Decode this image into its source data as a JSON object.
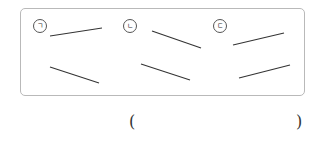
{
  "options": [
    {
      "label": "ㄱ",
      "circle": [
        39,
        25
      ],
      "segments": [
        [
          50,
          36,
          102,
          28
        ],
        [
          50,
          67,
          99,
          83
        ]
      ]
    },
    {
      "label": "ㄴ",
      "circle": [
        129,
        25
      ],
      "segments": [
        [
          152,
          31,
          201,
          48
        ],
        [
          141,
          64,
          190,
          80
        ]
      ]
    },
    {
      "label": "ㄷ",
      "circle": [
        219,
        25
      ],
      "segments": [
        [
          233,
          45,
          284,
          33
        ],
        [
          239,
          78,
          290,
          65
        ]
      ]
    }
  ],
  "answer": {
    "open": "(",
    "close": ")",
    "value": ""
  },
  "colors": {
    "line": "#333333",
    "border": "#b9b9b9"
  }
}
